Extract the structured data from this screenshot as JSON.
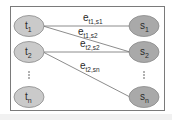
{
  "diagram": {
    "frame": {
      "x": 10,
      "y": 6,
      "w": 154,
      "h": 104,
      "stroke": "#7a7a7a"
    },
    "colors": {
      "left_fill": "#cacaca",
      "right_fill": "#a9a9a9",
      "node_stroke": "#8a8a8a",
      "edge_stroke": "#6e6e6e",
      "text": "#2a2a2a"
    },
    "left_nodes": [
      {
        "id": "t1",
        "base": "t",
        "sub": "1",
        "cx": 29,
        "cy": 26
      },
      {
        "id": "t2",
        "base": "t",
        "sub": "2",
        "cx": 29,
        "cy": 52
      },
      {
        "id": "tn",
        "base": "t",
        "sub": "n",
        "cx": 29,
        "cy": 97
      }
    ],
    "right_nodes": [
      {
        "id": "s1",
        "base": "s",
        "sub": "1",
        "cx": 144,
        "cy": 26
      },
      {
        "id": "s2",
        "base": "s",
        "sub": "2",
        "cx": 144,
        "cy": 52
      },
      {
        "id": "sn",
        "base": "s",
        "sub": "n",
        "cx": 144,
        "cy": 97
      }
    ],
    "edges": [
      {
        "from": "t1",
        "to": "s1",
        "label_base": "e",
        "label_sub": "t1,s1",
        "lx": 83,
        "ly": 21
      },
      {
        "from": "t1",
        "to": "s2",
        "label_base": "e",
        "label_sub": "t1,s2",
        "lx": 78,
        "ly": 35
      },
      {
        "from": "t2",
        "to": "s2",
        "label_base": "e",
        "label_sub": "t2,s2",
        "lx": 80,
        "ly": 47
      },
      {
        "from": "t2",
        "to": "sn",
        "label_base": "e",
        "label_sub": "t2,sn",
        "lx": 80,
        "ly": 69
      }
    ],
    "ellipsis": {
      "left": {
        "x": 29,
        "y": 75
      },
      "right": {
        "x": 144,
        "y": 75
      },
      "glyph": "⋮"
    }
  }
}
